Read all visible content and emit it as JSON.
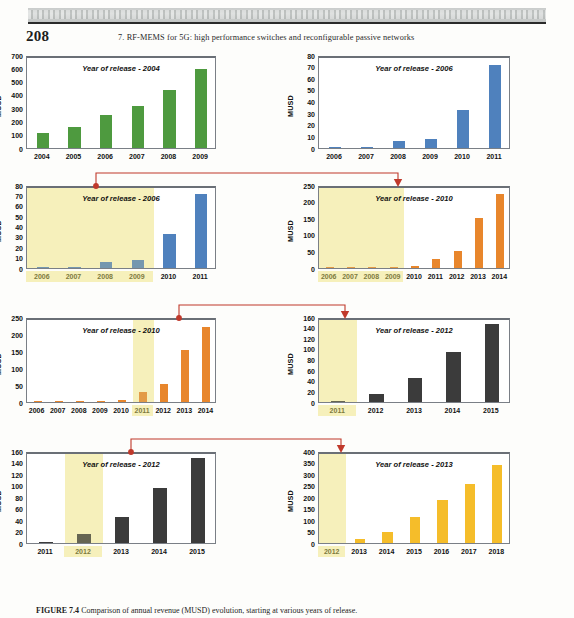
{
  "page": {
    "folio": "208",
    "running_head": "7. RF-MEMS for 5G: high performance switches and reconfigurable passive networks",
    "caption_label": "FIGURE 7.4",
    "caption_text": "Comparison of annual revenue (MUSD) evolution, starting at various years of release.",
    "accent_red": "#c0392b",
    "highlight_yellow": "#f6f0bb"
  },
  "chart_data": [
    {
      "id": "chart-2004",
      "type": "bar",
      "title": "Year of release - 2004",
      "ylabel": "MUSD",
      "xlabel": "",
      "categories": [
        "2004",
        "2005",
        "2006",
        "2007",
        "2008",
        "2009"
      ],
      "values": [
        110,
        160,
        245,
        315,
        435,
        595
      ],
      "yticks": [
        0,
        100,
        200,
        300,
        400,
        500,
        600,
        700
      ],
      "ylim": [
        0,
        700
      ],
      "color": "#4e9a3f",
      "grid": false,
      "highlight": [],
      "dim_labels": []
    },
    {
      "id": "chart-2006-a",
      "type": "bar",
      "title": "Year of release - 2006",
      "ylabel": "MUSD",
      "xlabel": "",
      "categories": [
        "2006",
        "2007",
        "2008",
        "2009",
        "2010",
        "2011"
      ],
      "values": [
        0.4,
        1.2,
        6,
        8,
        33,
        71
      ],
      "yticks": [
        0,
        10,
        20,
        30,
        40,
        50,
        60,
        70,
        80
      ],
      "ylim": [
        0,
        80
      ],
      "color": "#4f81bd",
      "grid": false,
      "highlight": [],
      "dim_labels": []
    },
    {
      "id": "chart-2006-b",
      "type": "bar",
      "title": "Year of release - 2006",
      "ylabel": "MUSD",
      "xlabel": "",
      "categories": [
        "2006",
        "2007",
        "2008",
        "2009",
        "2010",
        "2011"
      ],
      "values": [
        0.4,
        1.2,
        6,
        8,
        33,
        71
      ],
      "yticks": [
        0,
        10,
        20,
        30,
        40,
        50,
        60,
        70,
        80
      ],
      "ylim": [
        0,
        80
      ],
      "color": "#4f81bd",
      "grid": false,
      "highlight": [
        0,
        1,
        2,
        3
      ],
      "dim_labels": [
        0,
        1,
        2,
        3
      ]
    },
    {
      "id": "chart-2010-a",
      "type": "bar",
      "title": "Year of release - 2010",
      "ylabel": "MUSD",
      "xlabel": "",
      "categories": [
        "2006",
        "2007",
        "2008",
        "2009",
        "2010",
        "2011",
        "2012",
        "2013",
        "2014"
      ],
      "values": [
        1,
        1.5,
        2,
        2.5,
        6,
        28,
        52,
        152,
        222
      ],
      "yticks": [
        0,
        50,
        100,
        150,
        200,
        250
      ],
      "ylim": [
        0,
        250
      ],
      "color": "#e8862c",
      "grid": false,
      "highlight": [
        0,
        1,
        2,
        3
      ],
      "dim_labels": [
        0,
        1,
        2,
        3
      ]
    },
    {
      "id": "chart-2010-b",
      "type": "bar",
      "title": "Year of release - 2010",
      "ylabel": "MUSD",
      "xlabel": "",
      "categories": [
        "2006",
        "2007",
        "2008",
        "2009",
        "2010",
        "2011",
        "2012",
        "2013",
        "2014"
      ],
      "values": [
        1,
        1.5,
        2,
        2.5,
        6,
        28,
        52,
        152,
        222
      ],
      "yticks": [
        0,
        50,
        100,
        150,
        200,
        250
      ],
      "ylim": [
        0,
        250
      ],
      "color": "#e8862c",
      "grid": false,
      "highlight": [
        5
      ],
      "dim_labels": [
        5
      ]
    },
    {
      "id": "chart-2012-a",
      "type": "bar",
      "title": "Year of release - 2012",
      "ylabel": "MUSD",
      "xlabel": "",
      "categories": [
        "2011",
        "2012",
        "2013",
        "2014",
        "2015"
      ],
      "values": [
        1,
        16,
        45,
        95,
        147
      ],
      "yticks": [
        0,
        20,
        40,
        60,
        80,
        100,
        120,
        140,
        160
      ],
      "ylim": [
        0,
        160
      ],
      "color": "#3b3b3b",
      "grid": false,
      "highlight": [
        0
      ],
      "dim_labels": [
        0
      ]
    },
    {
      "id": "chart-2012-b",
      "type": "bar",
      "title": "Year of release - 2012",
      "ylabel": "MUSD",
      "xlabel": "",
      "categories": [
        "2011",
        "2012",
        "2013",
        "2014",
        "2015"
      ],
      "values": [
        1,
        16,
        45,
        95,
        147
      ],
      "yticks": [
        0,
        20,
        40,
        60,
        80,
        100,
        120,
        140,
        160
      ],
      "ylim": [
        0,
        160
      ],
      "color": "#3b3b3b",
      "grid": false,
      "highlight": [
        1
      ],
      "dim_labels": [
        1
      ]
    },
    {
      "id": "chart-2013",
      "type": "bar",
      "title": "Year of release - 2013",
      "ylabel": "MUSD",
      "xlabel": "",
      "categories": [
        "2012",
        "2013",
        "2014",
        "2015",
        "2016",
        "2017",
        "2018"
      ],
      "values": [
        0,
        18,
        48,
        115,
        185,
        255,
        340
      ],
      "yticks": [
        0,
        50,
        100,
        150,
        200,
        250,
        300,
        350,
        400
      ],
      "ylim": [
        0,
        400
      ],
      "color": "#f5bd2a",
      "grid": false,
      "highlight": [
        0
      ],
      "dim_labels": [
        0
      ]
    }
  ],
  "connectors": [
    {
      "name": "connector-2006-to-2010",
      "from_chart": "chart-2006-b",
      "to_chart": "chart-2010-a"
    },
    {
      "name": "connector-2010-to-2012",
      "from_chart": "chart-2010-b",
      "to_chart": "chart-2012-a"
    },
    {
      "name": "connector-2012-to-2013",
      "from_chart": "chart-2012-b",
      "to_chart": "chart-2013"
    }
  ]
}
